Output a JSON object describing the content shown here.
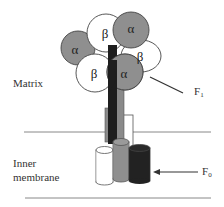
{
  "labels": {
    "matrix": "Matrix",
    "inner_membrane_line1": "Inner",
    "inner_membrane_line2": "membrane",
    "f1": "F",
    "f1_sub": "1",
    "f0": "F",
    "f0_sub": "0"
  },
  "subunits": {
    "alpha": "α",
    "beta": "β"
  },
  "colors": {
    "alpha_fill": "#8f8f8f",
    "beta_fill": "#ffffff",
    "stalk_dark": "#1e1e1e",
    "stalk_gray": "#8a8a8a",
    "cylinder_dark": "#222222",
    "line": "#777777"
  }
}
